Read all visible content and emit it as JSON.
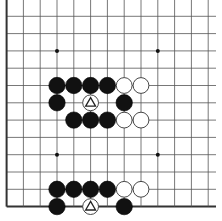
{
  "board": {
    "description": "Go board fragment (left and bottom edges visible, top and right open)",
    "columns_visible": 13,
    "rows_visible": 13,
    "origin_x": 6.6,
    "origin_y": -1.0,
    "spacing_x": 16.8,
    "spacing_y": 17.3,
    "line_color": "#555555",
    "edge_color": "#333333",
    "background": "#ffffff",
    "edges": {
      "left": true,
      "bottom": true,
      "top": false,
      "right": false
    },
    "star_points": [
      {
        "col": 3,
        "row": 3
      },
      {
        "col": 9,
        "row": 3
      },
      {
        "col": 3,
        "row": 9
      },
      {
        "col": 9,
        "row": 9
      }
    ],
    "stones": [
      {
        "col": 3,
        "row": 5,
        "color": "black"
      },
      {
        "col": 4,
        "row": 5,
        "color": "black"
      },
      {
        "col": 5,
        "row": 5,
        "color": "black"
      },
      {
        "col": 6,
        "row": 5,
        "color": "black"
      },
      {
        "col": 7,
        "row": 5,
        "color": "white"
      },
      {
        "col": 8,
        "row": 5,
        "color": "white"
      },
      {
        "col": 3,
        "row": 6,
        "color": "black"
      },
      {
        "col": 5,
        "row": 6,
        "color": "white",
        "marker": "triangle"
      },
      {
        "col": 7,
        "row": 6,
        "color": "black"
      },
      {
        "col": 4,
        "row": 7,
        "color": "black"
      },
      {
        "col": 5,
        "row": 7,
        "color": "black"
      },
      {
        "col": 6,
        "row": 7,
        "color": "black"
      },
      {
        "col": 7,
        "row": 7,
        "color": "white"
      },
      {
        "col": 8,
        "row": 7,
        "color": "white"
      },
      {
        "col": 3,
        "row": 11,
        "color": "black"
      },
      {
        "col": 4,
        "row": 11,
        "color": "black"
      },
      {
        "col": 5,
        "row": 11,
        "color": "black"
      },
      {
        "col": 6,
        "row": 11,
        "color": "black"
      },
      {
        "col": 7,
        "row": 11,
        "color": "white"
      },
      {
        "col": 8,
        "row": 11,
        "color": "white"
      },
      {
        "col": 3,
        "row": 12,
        "color": "black"
      },
      {
        "col": 5,
        "row": 12,
        "color": "white",
        "marker": "triangle"
      },
      {
        "col": 7,
        "row": 12,
        "color": "black"
      }
    ]
  },
  "caption": {
    "text": ""
  }
}
